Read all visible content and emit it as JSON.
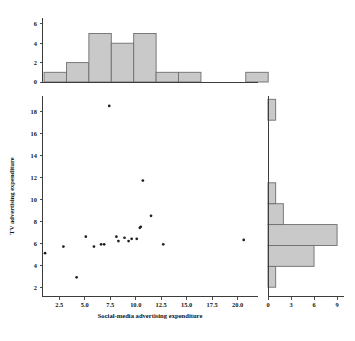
{
  "chart_data": {
    "type": "scatter",
    "title": "",
    "xlabel": "Social-media advertising expenditure",
    "ylabel": "TV advertising expenditure",
    "grid": false,
    "legend": "none",
    "xlim": [
      0.8,
      22.0
    ],
    "ylim": [
      1.2,
      19.4
    ],
    "xticks": [
      "2.5",
      "5.0",
      "7.5",
      "10.0",
      "12.5",
      "15.0",
      "17.5",
      "20.0"
    ],
    "xtick_values": [
      2.5,
      5.0,
      7.5,
      10.0,
      12.5,
      15.0,
      17.5,
      20.0
    ],
    "yticks": [
      "2",
      "4",
      "6",
      "8",
      "10",
      "12",
      "14",
      "16",
      "18"
    ],
    "ytick_values": [
      2,
      4,
      6,
      8,
      10,
      12,
      14,
      16,
      18
    ],
    "points": [
      {
        "x": 1.1,
        "y": 5.1
      },
      {
        "x": 2.9,
        "y": 5.7
      },
      {
        "x": 4.2,
        "y": 2.9
      },
      {
        "x": 5.1,
        "y": 6.6
      },
      {
        "x": 5.9,
        "y": 5.7
      },
      {
        "x": 6.6,
        "y": 5.9
      },
      {
        "x": 6.9,
        "y": 5.9
      },
      {
        "x": 7.4,
        "y": 18.5
      },
      {
        "x": 8.1,
        "y": 6.6
      },
      {
        "x": 8.3,
        "y": 6.2
      },
      {
        "x": 8.9,
        "y": 6.5
      },
      {
        "x": 9.3,
        "y": 6.2
      },
      {
        "x": 9.6,
        "y": 6.4
      },
      {
        "x": 10.1,
        "y": 6.4
      },
      {
        "x": 10.4,
        "y": 7.4
      },
      {
        "x": 10.5,
        "y": 7.5
      },
      {
        "x": 10.7,
        "y": 11.7
      },
      {
        "x": 11.5,
        "y": 8.5
      },
      {
        "x": 12.7,
        "y": 5.9
      },
      {
        "x": 20.6,
        "y": 6.3
      }
    ],
    "marginal_top": {
      "type": "bar",
      "orientation": "vertical",
      "ylabel": "",
      "yticks": [
        "0",
        "2",
        "4",
        "6"
      ],
      "ytick_values": [
        0,
        2,
        4,
        6
      ],
      "ylim": [
        0,
        6.6
      ],
      "bin_edges": [
        1.0,
        3.2,
        5.4,
        7.6,
        9.8,
        12.0,
        14.2,
        16.4,
        18.6,
        20.8,
        23.0
      ],
      "counts": [
        1,
        2,
        5,
        4,
        5,
        1,
        1,
        0,
        0,
        1
      ]
    },
    "marginal_right": {
      "type": "bar",
      "orientation": "horizontal",
      "xlabel": "",
      "xticks": [
        "0",
        "3",
        "6",
        "9"
      ],
      "xtick_values": [
        0,
        3,
        6,
        9
      ],
      "xlim": [
        0,
        9.9
      ],
      "bin_edges": [
        2.0,
        3.9,
        5.8,
        7.7,
        9.6,
        11.5,
        13.4,
        15.3,
        17.2,
        19.1
      ],
      "counts": [
        1,
        6,
        9,
        2,
        1,
        0,
        0,
        0,
        1
      ]
    }
  }
}
